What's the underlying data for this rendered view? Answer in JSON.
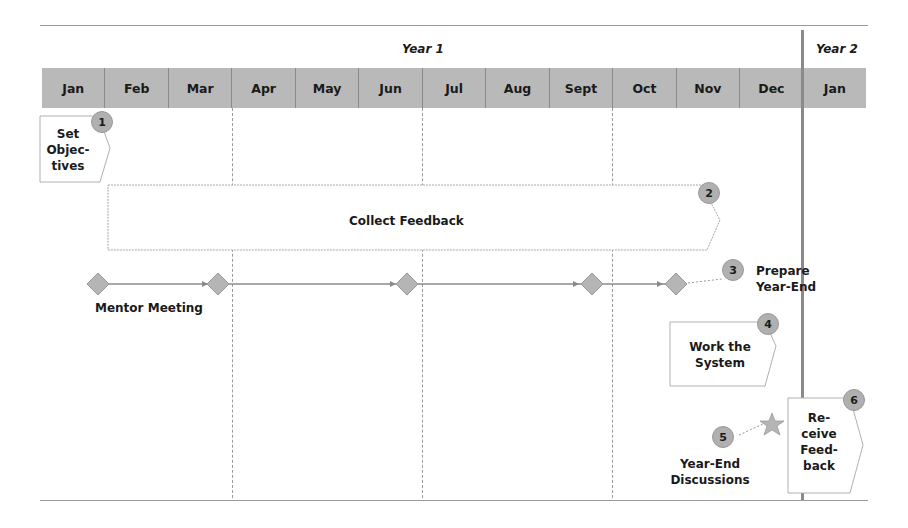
{
  "timeline": {
    "year_labels": {
      "year1": "Year 1",
      "year2": "Year 2"
    },
    "months": [
      "Jan",
      "Feb",
      "Mar",
      "Apr",
      "May",
      "Jun",
      "Jul",
      "Aug",
      "Sept",
      "Oct",
      "Nov",
      "Dec",
      "Jan"
    ]
  },
  "steps": [
    {
      "number": "1",
      "label_lines": [
        "Set",
        "Objec-",
        "tives"
      ]
    },
    {
      "number": "2",
      "label": "Collect Feedback"
    },
    {
      "number": "3",
      "label_lines": [
        "Prepare",
        "Year-End"
      ]
    },
    {
      "number": "4",
      "label_lines": [
        "Work the",
        "System"
      ]
    },
    {
      "number": "5",
      "label_lines": [
        "Year-End",
        "Discussions"
      ]
    },
    {
      "number": "6",
      "label_lines": [
        "Re-",
        "ceive",
        "Feed-",
        "back"
      ]
    }
  ],
  "mentor_meeting": {
    "label": "Mentor Meeting",
    "milestone_months": [
      "Jan",
      "Mar",
      "Jun",
      "Sept",
      "Oct"
    ]
  },
  "colors": {
    "month_fill": "#b9b9b9",
    "badge_fill": "#b0b0b0",
    "line": "#8a8a8a"
  }
}
